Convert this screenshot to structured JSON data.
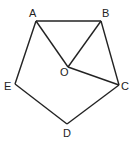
{
  "diagram": {
    "stroke_color": "#222222",
    "background": "#ffffff",
    "points": {
      "A": {
        "label": "A",
        "x": 36,
        "y": 21,
        "lx": 29,
        "ly": 17
      },
      "B": {
        "label": "B",
        "x": 101,
        "y": 21,
        "lx": 102,
        "ly": 17
      },
      "C": {
        "label": "C",
        "x": 119,
        "y": 85,
        "lx": 121,
        "ly": 90
      },
      "D": {
        "label": "D",
        "x": 67,
        "y": 124,
        "lx": 63,
        "ly": 137
      },
      "E": {
        "label": "E",
        "x": 15,
        "y": 84,
        "lx": 4,
        "ly": 90
      },
      "O": {
        "label": "O",
        "x": 68,
        "y": 67,
        "lx": 60,
        "ly": 76
      }
    },
    "segments": [
      [
        "A",
        "B"
      ],
      [
        "B",
        "C"
      ],
      [
        "C",
        "D"
      ],
      [
        "D",
        "E"
      ],
      [
        "E",
        "A"
      ],
      [
        "A",
        "O"
      ],
      [
        "B",
        "O"
      ],
      [
        "C",
        "O"
      ]
    ]
  }
}
